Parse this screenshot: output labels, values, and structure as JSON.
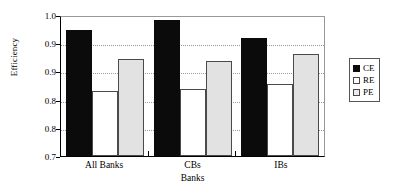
{
  "chart_data": {
    "type": "bar",
    "title": "",
    "xlabel": "Banks",
    "ylabel": "Efficiency",
    "categories": [
      "All Banks",
      "CBs",
      "IBs"
    ],
    "series": [
      {
        "name": "CE",
        "color": "#0b0b0b",
        "values": [
          0.968,
          0.989,
          0.951
        ]
      },
      {
        "name": "RE",
        "color": "#ffffff",
        "values": [
          0.838,
          0.843,
          0.853
        ]
      },
      {
        "name": "PE",
        "color": "#e2e2e2",
        "values": [
          0.906,
          0.902,
          0.917
        ]
      }
    ],
    "ylim": [
      0.7,
      1.0
    ],
    "ytick_values": [
      1.0,
      0.94,
      0.88,
      0.82,
      0.76,
      0.7
    ],
    "ytick_labels": [
      "1.0",
      "0.9",
      "0.9",
      "0.8",
      "0.8",
      "0.7"
    ],
    "grid": true,
    "grid_axis": "y",
    "legend_position": "right"
  },
  "legend": {
    "items": [
      {
        "label": "CE",
        "swatch": "legend-swatch-ce"
      },
      {
        "label": "RE",
        "swatch": "legend-swatch-re"
      },
      {
        "label": "PE",
        "swatch": "legend-swatch-pe"
      }
    ]
  }
}
